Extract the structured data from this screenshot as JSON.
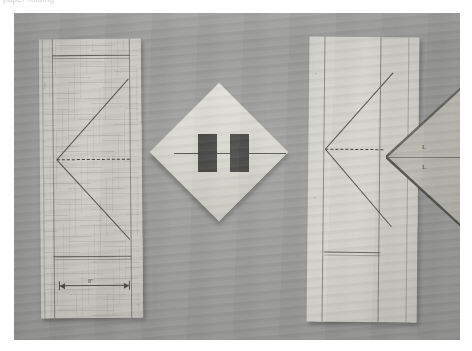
{
  "caption": {
    "text": "paper folding"
  },
  "photo": {
    "surface_color": "#9b9b99",
    "description": "Photograph of three folded paper sheets on a gray wooden surface"
  },
  "papers": {
    "left": {
      "name": "graph-paper-sheet",
      "paper_color": "#c9c8c2",
      "line_color": "#55544d",
      "dimension_label": "8\"",
      "tick_label": "|",
      "notes": "Ruled grid sheet with left-pointing chevron, top and bottom rules, and a dimension line"
    },
    "middle": {
      "name": "diamond-folded-sheet",
      "paper_color": "#d8d7cf",
      "bar_color": "#3b3b39",
      "bar_count": 2,
      "notes": "Square sheet rotated 45 degrees with two dark rectangular bars and a center line"
    },
    "right": {
      "name": "folded-sheet-with-flap",
      "paper_color": "#d2d1cb",
      "flap_color": "#b2b1aa",
      "line_color": "#55544d",
      "flap_label_top": "L",
      "flap_label_bottom": "L",
      "notes": "Sheet with left-pointing chevron and a large triangular flap folded out to the right"
    }
  }
}
